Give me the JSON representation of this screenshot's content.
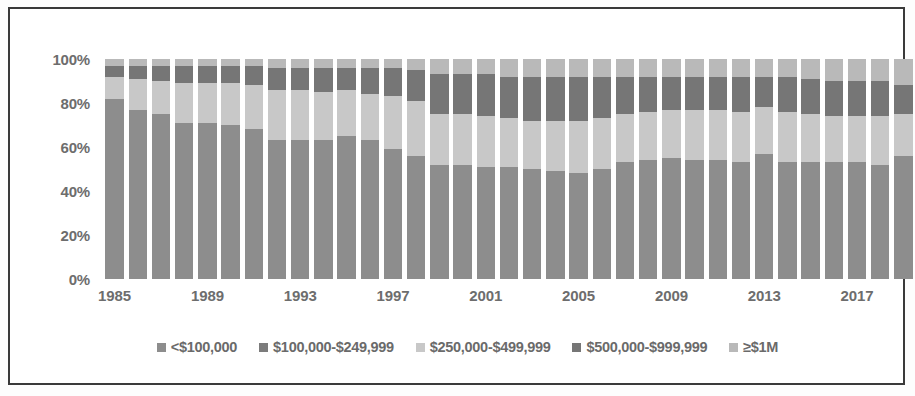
{
  "chart_data": {
    "type": "bar",
    "stacked": true,
    "normalized": "100%",
    "title": "",
    "subtitle": "",
    "xlabel": "",
    "ylabel": "",
    "ylim": [
      0,
      100
    ],
    "ytick_labels": [
      "0%",
      "20%",
      "40%",
      "60%",
      "80%",
      "100%"
    ],
    "ytick_values": [
      0,
      20,
      40,
      60,
      80,
      100
    ],
    "grid": false,
    "legend_position": "bottom",
    "categories": [
      "1985",
      "1986",
      "1987",
      "1988",
      "1989",
      "1990",
      "1991",
      "1992",
      "1993",
      "1994",
      "1995",
      "1996",
      "1997",
      "1998",
      "1999",
      "2000",
      "2001",
      "2002",
      "2003",
      "2004",
      "2005",
      "2006",
      "2007",
      "2008",
      "2009",
      "2010",
      "2011",
      "2012",
      "2013",
      "2014",
      "2015",
      "2016",
      "2017",
      "2018",
      "2019"
    ],
    "xtick_labels": [
      "1985",
      "1989",
      "1993",
      "1997",
      "2001",
      "2005",
      "2009",
      "2013",
      "2017"
    ],
    "xtick_categories": [
      "1985",
      "1989",
      "1993",
      "1997",
      "2001",
      "2005",
      "2009",
      "2013",
      "2017"
    ],
    "series": [
      {
        "name": "<$100,000",
        "color": "#8d8d8d",
        "values": [
          82,
          77,
          75,
          71,
          71,
          70,
          68,
          63,
          63,
          63,
          65,
          63,
          59,
          56,
          52,
          52,
          51,
          51,
          50,
          49,
          48,
          50,
          53,
          54,
          55,
          54,
          54,
          53,
          57,
          53,
          53,
          53,
          53,
          52,
          56
        ]
      },
      {
        "name": "$100,000-$249,999",
        "color": "#7c7c7c",
        "values": [
          0,
          0,
          0,
          0,
          0,
          0,
          0,
          0,
          0,
          0,
          0,
          0,
          0,
          0,
          0,
          0,
          0,
          0,
          0,
          0,
          0,
          0,
          0,
          0,
          0,
          0,
          0,
          0,
          0,
          0,
          0,
          0,
          0,
          0,
          0
        ]
      },
      {
        "name": "$250,000-$499,999",
        "color": "#c8c8c8",
        "values": [
          10,
          14,
          15,
          18,
          18,
          19,
          20,
          23,
          23,
          22,
          21,
          21,
          24,
          25,
          23,
          23,
          23,
          22,
          22,
          23,
          24,
          23,
          22,
          22,
          22,
          23,
          23,
          23,
          21,
          23,
          22,
          21,
          21,
          22,
          19
        ]
      },
      {
        "name": "$500,000-$999,999",
        "color": "#767676",
        "values": [
          5,
          6,
          7,
          8,
          8,
          8,
          9,
          10,
          10,
          11,
          10,
          12,
          13,
          14,
          18,
          18,
          19,
          19,
          20,
          20,
          20,
          19,
          17,
          16,
          15,
          15,
          15,
          16,
          14,
          16,
          16,
          16,
          16,
          16,
          13
        ]
      },
      {
        "name": "≥$1M",
        "color": "#b9b9b9",
        "values": [
          3,
          3,
          3,
          3,
          3,
          3,
          3,
          4,
          4,
          4,
          4,
          4,
          4,
          5,
          7,
          7,
          7,
          8,
          8,
          8,
          8,
          8,
          8,
          8,
          8,
          8,
          8,
          8,
          8,
          8,
          9,
          10,
          10,
          10,
          12
        ]
      }
    ],
    "legend_entries": [
      {
        "label": "<$100,000",
        "color": "#8d8d8d"
      },
      {
        "label": "$100,000-$249,999",
        "color": "#7c7c7c"
      },
      {
        "label": "$250,000-$499,999",
        "color": "#c8c8c8"
      },
      {
        "label": "$500,000-$999,999",
        "color": "#767676"
      },
      {
        "label": "≥$1M",
        "color": "#b9b9b9"
      }
    ]
  },
  "colors": {
    "frame": "#3a3a3a",
    "background": "#ffffff",
    "axis_text": "#6d6d6d",
    "legend_text": "#6a6a6a"
  }
}
